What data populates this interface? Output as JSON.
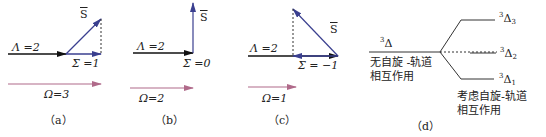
{
  "colors": {
    "lambda_vector": "#111111",
    "sigma_vector": "#3a3f8f",
    "spin_vector": "#3a3f8f",
    "omega_vector": "#b06a8a",
    "projection_dashed": "#333333",
    "level_lines": "#333333"
  },
  "panels": [
    {
      "caption": "（a）",
      "lambda_label": "Λ =2",
      "sigma_label": "Σ =1",
      "spin_label": "S",
      "omega_label": "Ω=3",
      "lambda": 2,
      "sigma": 1,
      "omega": 3
    },
    {
      "caption": "（b）",
      "lambda_label": "Λ =2",
      "sigma_label": "Σ =0",
      "spin_label": "S",
      "omega_label": "Ω=2",
      "lambda": 2,
      "sigma": 0,
      "omega": 2
    },
    {
      "caption": "（c）",
      "lambda_label": "Λ =2",
      "sigma_label": "Σ = −1",
      "spin_label": "S",
      "omega_label": "Ω=1",
      "lambda": 2,
      "sigma": -1,
      "omega": 1
    }
  ],
  "energy_diagram": {
    "caption": "（d）",
    "unperturbed_state": {
      "sup": "3",
      "term": "Δ",
      "sub": ""
    },
    "unperturbed_note": [
      "无自旋 -轨道",
      "相互作用"
    ],
    "split_states": [
      {
        "sup": "3",
        "term": "Δ",
        "sub": "3"
      },
      {
        "sup": "3",
        "term": "Δ",
        "sub": "2"
      },
      {
        "sup": "3",
        "term": "Δ",
        "sub": "1"
      }
    ],
    "split_note": [
      "考虑自旋-轨道",
      "相互作用"
    ]
  }
}
